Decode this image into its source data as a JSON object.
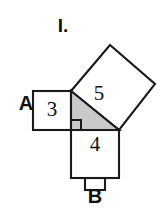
{
  "figure": {
    "title": "I.",
    "colors": {
      "stroke": "#1a1a1a",
      "square_fill": "#ffffff",
      "triangle_fill": "#c9c9c9",
      "background": "#ffffff",
      "text": "#111111"
    },
    "squares": [
      {
        "id": "square-a",
        "number_label": "3",
        "side_label": "A",
        "orientation": "axis-aligned-left"
      },
      {
        "id": "square-b",
        "number_label": "4",
        "side_label": "B",
        "orientation": "axis-aligned-bottom"
      },
      {
        "id": "square-c",
        "number_label": "5",
        "side_label": "",
        "orientation": "tilted-hypotenuse"
      }
    ],
    "triangle": {
      "id": "right-triangle",
      "legs": [
        "3",
        "4"
      ],
      "hypotenuse": "5",
      "right_angle_marker": true
    }
  }
}
